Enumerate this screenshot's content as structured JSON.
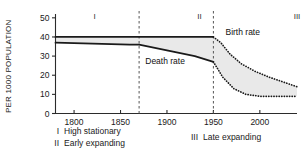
{
  "chart_data": {
    "type": "line",
    "title": "",
    "xlabel": "",
    "ylabel": "PER 1000 POPULATION",
    "xlim": [
      1780,
      2040
    ],
    "ylim": [
      0,
      52
    ],
    "grid": false,
    "legend_position": "below-axis",
    "x_ticks": [
      1800,
      1850,
      1900,
      1950,
      2000
    ],
    "x_tick_labels": [
      "1800",
      "1850",
      "1900",
      "1950",
      "2000"
    ],
    "y_ticks": [
      0,
      10,
      20,
      30,
      40,
      50
    ],
    "y_tick_labels": [
      "0",
      "10",
      "20",
      "30",
      "40",
      "50"
    ],
    "annotations": [
      {
        "name": "birth-rate-label",
        "text": "Birth rate",
        "x": 1963,
        "y": 41
      },
      {
        "name": "death-rate-label",
        "text": "Death rate",
        "x": 1898,
        "y": 26
      }
    ],
    "stage_labels": [
      {
        "name": "stage-one-marker",
        "text": "I",
        "x": 1822
      },
      {
        "name": "stage-two-marker",
        "text": "II",
        "x": 1935
      },
      {
        "name": "stage-three-marker",
        "text": "III",
        "x": 2040
      }
    ],
    "stage_dividers": [
      1870,
      1950
    ],
    "series": [
      {
        "name": "Birth rate",
        "observed": {
          "x": [
            1780,
            1820,
            1860,
            1870,
            1900,
            1930,
            1950
          ],
          "values": [
            40,
            40,
            40,
            40,
            40,
            40,
            40
          ]
        },
        "projected": {
          "x": [
            1950,
            1958,
            1968,
            1980,
            1995,
            2010,
            2040
          ],
          "values": [
            40,
            37,
            31,
            26,
            22,
            19,
            14
          ]
        }
      },
      {
        "name": "Death rate",
        "observed": {
          "x": [
            1780,
            1820,
            1860,
            1870,
            1900,
            1930,
            1950
          ],
          "values": [
            37,
            36.5,
            36,
            36,
            33,
            30,
            27
          ]
        },
        "projected": {
          "x": [
            1950,
            1960,
            1972,
            1985,
            2000,
            2020,
            2040
          ],
          "values": [
            27,
            19,
            13,
            10,
            9,
            9,
            9
          ]
        }
      }
    ],
    "band": {
      "name": "natural-increase-band",
      "description": "Shaded area between birth rate and death rate",
      "color": "#e9e9e9"
    }
  },
  "legend": {
    "entries": [
      {
        "marker": "I",
        "label": "High stationary"
      },
      {
        "marker": "II",
        "label": "Early expanding"
      },
      {
        "marker": "III",
        "label": "Late expanding"
      }
    ]
  }
}
